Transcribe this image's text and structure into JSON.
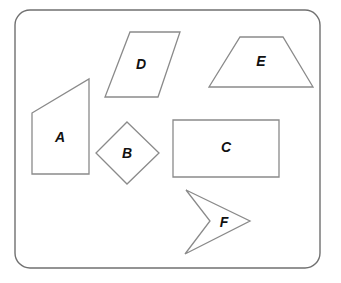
{
  "diagram": {
    "title": "",
    "frame": {
      "x": 15,
      "y": 10,
      "width": 305,
      "height": 258,
      "radius": 15,
      "stroke": "#707070"
    },
    "shapes": [
      {
        "id": "D",
        "label": "D",
        "type": "parallelogram",
        "points": "130,32 180,32 158,97 105,97",
        "label_pos": [
          141,
          65
        ]
      },
      {
        "id": "E",
        "label": "E",
        "type": "trapezoid",
        "points": "240,37 283,37 313,87 209,87",
        "label_pos": [
          261,
          62
        ]
      },
      {
        "id": "A",
        "label": "A",
        "type": "quadrilateral",
        "points": "32,113 89,79 89,174 32,174",
        "label_pos": [
          60,
          138
        ]
      },
      {
        "id": "B",
        "label": "B",
        "type": "square-rotated",
        "points": "127,122 159,153 127,184 96,153",
        "label_pos": [
          127,
          154
        ]
      },
      {
        "id": "C",
        "label": "C",
        "type": "rectangle",
        "points": "173,120 279,120 279,177 173,177",
        "label_pos": [
          226,
          148
        ]
      },
      {
        "id": "F",
        "label": "F",
        "type": "concave-quadrilateral",
        "points": "186,190 250,221 185,254 210,221",
        "label_pos": [
          224,
          223
        ]
      }
    ],
    "stroke_color": "#8a8a8a"
  }
}
